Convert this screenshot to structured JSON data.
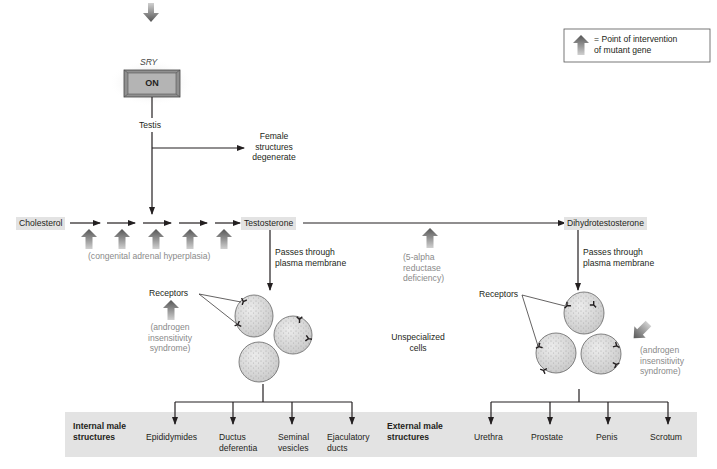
{
  "legend": {
    "icon": "up-arrow-icon",
    "label_line1": "= Point of intervention",
    "label_line2": "of mutant gene"
  },
  "gene": {
    "name": "SRY",
    "switch_label": "ON"
  },
  "testis_label": "Testis",
  "female_branch": {
    "line1": "Female",
    "line2": "structures",
    "line3": "degenerate"
  },
  "pathway": {
    "start": "Cholesterol",
    "middle": "Testosterone",
    "end": "Dihydrotestosterone",
    "step_count": 5
  },
  "defects": {
    "cah": "(congenital adrenal hyperplasia)",
    "five_alpha_line1": "(5-alpha",
    "five_alpha_line2": "reductase",
    "five_alpha_line3": "deficiency)",
    "ais_left_line1": "(androgen",
    "ais_left_line2": "insensitivity",
    "ais_left_line3": "syndrome)",
    "ais_right_line1": "(androgen",
    "ais_right_line2": "insensitivity",
    "ais_right_line3": "syndrome)"
  },
  "membrane_left": {
    "line1": "Passes through",
    "line2": "plasma membrane"
  },
  "membrane_right": {
    "line1": "Passes through",
    "line2": "plasma membrane"
  },
  "receptors_left": "Receptors",
  "receptors_right": "Receptors",
  "unspecialized": {
    "line1": "Unspecialized",
    "line2": "cells"
  },
  "internal": {
    "heading_line1": "Internal male",
    "heading_line2": "structures",
    "items": [
      {
        "line1": "Epididymides",
        "line2": ""
      },
      {
        "line1": "Ductus",
        "line2": "deferentia"
      },
      {
        "line1": "Seminal",
        "line2": "vesicles"
      },
      {
        "line1": "Ejaculatory",
        "line2": "ducts"
      }
    ]
  },
  "external": {
    "heading_line1": "External male",
    "heading_line2": "structures",
    "items": [
      {
        "line1": "Urethra"
      },
      {
        "line1": "Prostate"
      },
      {
        "line1": "Penis"
      },
      {
        "line1": "Scrotum"
      }
    ]
  },
  "colors": {
    "band": "#e3e3e3",
    "chip": "#e3e3e3",
    "defect_text": "#8a8a8a",
    "arrow_dark": "#5a5a5a",
    "arrow_light": "#c8c8c8",
    "cell_fill": "#d9d9d9"
  }
}
